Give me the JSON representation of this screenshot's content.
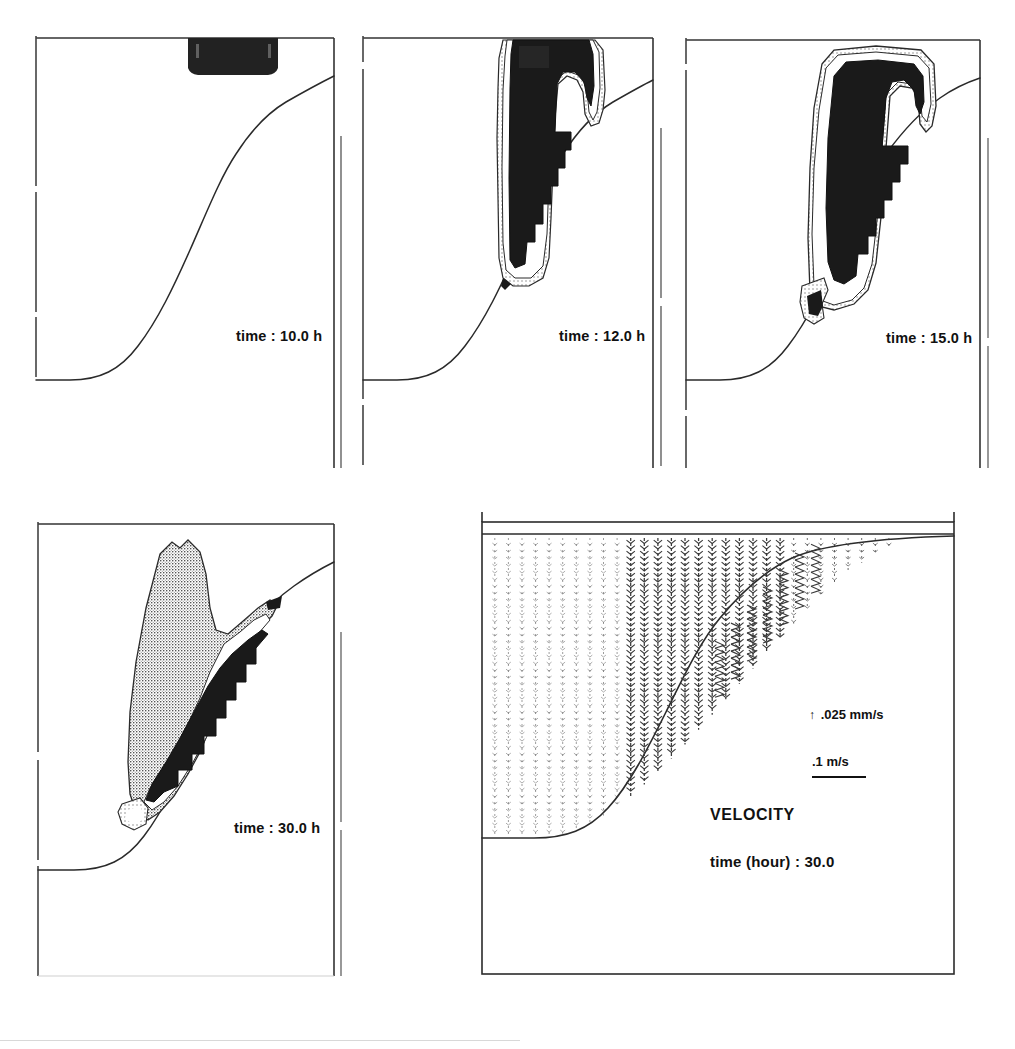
{
  "figure": {
    "background_color": "#ffffff",
    "ink_color": "#1a1a1a"
  },
  "panels": [
    {
      "id": "panel-t10",
      "time_label": "time :  10.0 h",
      "time_value": 10.0,
      "time_unit": "h",
      "has_plume": false,
      "has_source_box": true,
      "source_box_note": "dark discharge block at free surface"
    },
    {
      "id": "panel-t12",
      "time_label": "time :  12.0 h",
      "time_value": 12.0,
      "time_unit": "h",
      "has_plume": true,
      "has_source_box": false
    },
    {
      "id": "panel-t15",
      "time_label": "time :  15.0 h",
      "time_value": 15.0,
      "time_unit": "h",
      "has_plume": true,
      "has_source_box": false
    },
    {
      "id": "panel-t30",
      "time_label": "time :  30.0 h",
      "time_value": 30.0,
      "time_unit": "h",
      "has_plume": true,
      "has_source_box": false
    }
  ],
  "velocity_panel": {
    "id": "panel-velocity",
    "title": "VELOCITY",
    "time_label": "time (hour) :  30.0",
    "time_value": 30.0,
    "time_unit": "hour",
    "legend": {
      "vector_symbol": "↑",
      "vector_scale": ".025 mm/s",
      "bar_scale": ".1 m/s"
    }
  },
  "chart_data": {
    "type": "area",
    "xlabel": "",
    "ylabel": "",
    "grid": false,
    "legend_position": "inside-right",
    "series": [
      {
        "name": "bed-profile",
        "description": "seabed / bathymetry profile, flat at left then rising S-curve to the right",
        "x": [
          0,
          0.08,
          0.16,
          0.24,
          0.32,
          0.4,
          0.48,
          0.56,
          0.64,
          0.72,
          0.8,
          0.88,
          0.94,
          1.0
        ],
        "y": [
          0.0,
          0.0,
          0.02,
          0.07,
          0.15,
          0.26,
          0.38,
          0.5,
          0.62,
          0.74,
          0.84,
          0.92,
          0.96,
          1.0
        ]
      },
      {
        "name": "plume-outer-contour",
        "description": "lowest concentration contour, stippled light grey"
      },
      {
        "name": "plume-mid-contour",
        "description": "intermediate concentration contour, white band"
      },
      {
        "name": "plume-core-contour",
        "description": "highest concentration core, solid black, stepped along the bed"
      }
    ],
    "velocity_field": {
      "type": "quiver",
      "orientation": "predominantly downward (settling) vectors in vertical columns",
      "columns": 34,
      "reference_vector": ".025 mm/s",
      "reference_bar": ".1 m/s",
      "time": 30.0
    }
  }
}
